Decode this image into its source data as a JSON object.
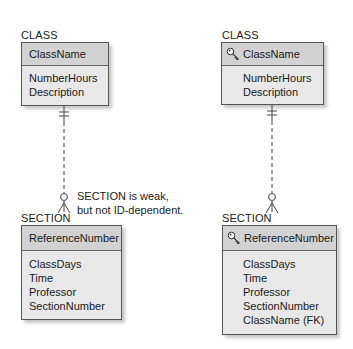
{
  "left": {
    "parent": {
      "entity_label": "CLASS",
      "identifier": "ClassName",
      "identifier_has_key_icon": false,
      "attributes": [
        "NumberHours",
        "Description"
      ]
    },
    "child": {
      "entity_label": "SECTION",
      "identifier": "ReferenceNumber",
      "identifier_has_key_icon": false,
      "attributes": [
        "ClassDays",
        "Time",
        "Professor",
        "SectionNumber"
      ]
    },
    "relationship": {
      "parent_end": "mandatory-one",
      "child_end": "optional-many",
      "line_style": "dashed"
    },
    "annotation": [
      "SECTION is weak,",
      "but not ID-dependent."
    ]
  },
  "right": {
    "parent": {
      "entity_label": "CLASS",
      "identifier": "ClassName",
      "identifier_has_key_icon": true,
      "attributes": [
        "NumberHours",
        "Description"
      ]
    },
    "child": {
      "entity_label": "SECTION",
      "identifier": "ReferenceNumber",
      "identifier_has_key_icon": true,
      "attributes": [
        "ClassDays",
        "Time",
        "Professor",
        "SectionNumber",
        "ClassName (FK)"
      ]
    },
    "relationship": {
      "parent_end": "mandatory-one",
      "child_end": "optional-many",
      "line_style": "dashed"
    }
  },
  "icons": {
    "key": "key-icon"
  },
  "colors": {
    "header_fill": "#d2d2d2",
    "body_fill": "#e8e8e8",
    "border": "#555555"
  }
}
